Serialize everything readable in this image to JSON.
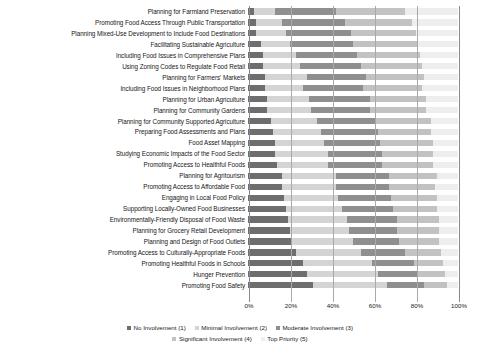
{
  "chart_data": {
    "type": "bar",
    "orientation": "horizontal",
    "stacked": true,
    "stack_mode": "percent",
    "title": "",
    "subtitle": "",
    "xlabel": "",
    "ylabel": "",
    "xlim": [
      0,
      100
    ],
    "xticks": [
      0,
      20,
      40,
      60,
      80,
      100
    ],
    "xticklabels": [
      "0%",
      "20%",
      "40%",
      "60%",
      "80%",
      "100%"
    ],
    "grid": true,
    "grid_axis": "x",
    "legend_position": "bottom",
    "categories": [
      "Planning for Farmland Preservation",
      "Promoting Food Access Through Public Transportation",
      "Planning Mixed-Use Development to Include Food Destinations",
      "Facilitating Sustainable Agriculture",
      "Including Food Issues in Comprehensive Plans",
      "Using Zoning Codes to Regulate Food Retail",
      "Planning for Farmers' Markets",
      "Including Food Issues in Neighborhood Plans",
      "Planning for Urban Agriculture",
      "Planning for Community Gardens",
      "Planning for Community Supported Agriculture",
      "Preparing Food Assessments and Plans",
      "Food Asset Mapping",
      "Studying Economic Impacts of the Food Sector",
      "Promoting Access to Healthful Foods",
      "Planning for Agritourism",
      "Promoting Access to Affordable Food",
      "Engaging in Local Food Policy",
      "Supporting Locally-Owned Food Businesses",
      "Environmentally-Friendly Disposal of Food Waste",
      "Planning for Grocery Retail Development",
      "Planning and Design of Food Outlets",
      "Promoting Access to Culturally-Appropriate Foods",
      "Promoting Healthful Foods in Schools",
      "Hunger Prevention",
      "Promoting Food Safety"
    ],
    "series": [
      {
        "name": "No Involvement (1)",
        "color": "#6e6e6e",
        "values": [
          3,
          4,
          4,
          6,
          7,
          7,
          8,
          8,
          9,
          9,
          11,
          12,
          13,
          13,
          14,
          16,
          16,
          17,
          18,
          19,
          20,
          21,
          23,
          26,
          28,
          31
        ]
      },
      {
        "name": "Minimal Involvement (2)",
        "color": "#d4d4d4",
        "values": [
          10,
          12,
          14,
          14,
          16,
          18,
          20,
          18,
          20,
          21,
          22,
          23,
          23,
          25,
          24,
          26,
          26,
          26,
          27,
          28,
          28,
          29,
          31,
          33,
          34,
          35
        ]
      },
      {
        "name": "Moderate Involvement (3)",
        "color": "#8f8f8f",
        "values": [
          29,
          30,
          31,
          30,
          29,
          29,
          28,
          29,
          29,
          28,
          28,
          27,
          27,
          26,
          26,
          25,
          25,
          25,
          24,
          24,
          23,
          22,
          21,
          20,
          19,
          18
        ]
      },
      {
        "name": "Significant Involvement (4)",
        "color": "#c2c2c2",
        "values": [
          33,
          32,
          31,
          31,
          30,
          29,
          28,
          28,
          27,
          27,
          26,
          25,
          25,
          24,
          24,
          23,
          22,
          22,
          21,
          20,
          20,
          19,
          17,
          14,
          13,
          11
        ]
      },
      {
        "name": "Top Priority (5)",
        "color": "#eeeeee",
        "values": [
          25,
          22,
          20,
          19,
          18,
          17,
          16,
          17,
          15,
          15,
          13,
          13,
          12,
          12,
          12,
          10,
          11,
          10,
          10,
          9,
          9,
          9,
          8,
          7,
          6,
          5
        ]
      }
    ]
  }
}
